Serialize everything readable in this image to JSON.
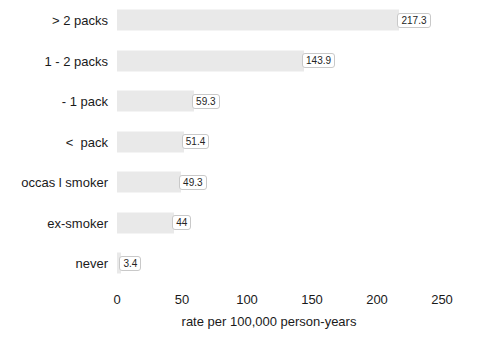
{
  "chart_data": {
    "type": "bar",
    "orientation": "horizontal",
    "title": "",
    "xlabel": "rate per 100,000 person-years",
    "ylabel": "",
    "categories": [
      "> 2 packs",
      "1 - 2 packs",
      "- 1 pack",
      "<  pack",
      "occas l smoker",
      "ex-smoker",
      "never"
    ],
    "values": [
      217.3,
      143.9,
      59.3,
      51.4,
      49.3,
      44,
      3.4
    ],
    "value_labels": [
      "217.3",
      "143.9",
      "59.3",
      "51.4",
      "49.3",
      "44",
      "3.4"
    ],
    "xlim": [
      0,
      250
    ],
    "xticks": [
      0,
      50,
      100,
      150,
      200,
      250
    ],
    "xtick_labels": [
      "0",
      "50",
      "100",
      "150",
      "200",
      "250"
    ],
    "grid": false,
    "legend": false,
    "bar_color": "#e9e9e9",
    "text_color": "#1a1a1a",
    "label_box_border": "#c9c9c9",
    "label_box_fill": "#ffffff",
    "background": "#ffffff"
  },
  "axis": {
    "title": "rate per 100,000 person-years"
  },
  "rows": [
    {
      "label": "> 2 packs",
      "value_label": "217.3"
    },
    {
      "label": "1 - 2 packs",
      "value_label": "143.9"
    },
    {
      "label": "- 1 pack",
      "value_label": "59.3"
    },
    {
      "label": "<  pack",
      "value_label": "51.4"
    },
    {
      "label": "occas l smoker",
      "value_label": "49.3"
    },
    {
      "label": "ex-smoker",
      "value_label": "44"
    },
    {
      "label": "never",
      "value_label": "3.4"
    }
  ],
  "ticks": [
    {
      "label": "0"
    },
    {
      "label": "50"
    },
    {
      "label": "100"
    },
    {
      "label": "150"
    },
    {
      "label": "200"
    },
    {
      "label": "250"
    }
  ]
}
